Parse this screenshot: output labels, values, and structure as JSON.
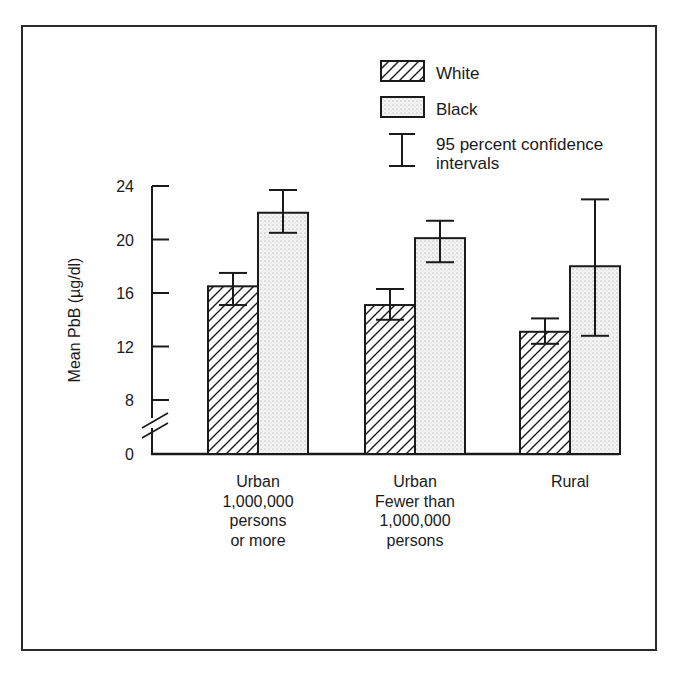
{
  "chart_data": {
    "type": "bar",
    "title": "",
    "xlabel": "",
    "ylabel": "Mean PbB (µg/dl)",
    "ylim": [
      0,
      24
    ],
    "yticks": [
      0,
      8,
      12,
      16,
      20,
      24
    ],
    "axis_break": "between 0 and 8",
    "grid": false,
    "legend_position": "top-right",
    "categories": [
      [
        "Urban",
        "1,000,000",
        "persons",
        "or more"
      ],
      [
        "Urban",
        "Fewer than",
        "1,000,000",
        "persons"
      ],
      [
        "Rural"
      ]
    ],
    "category_labels": [
      "Urban 1,000,000 persons or more",
      "Urban Fewer than 1,000,000 persons",
      "Rural"
    ],
    "series": [
      {
        "name": "White",
        "pattern": "diagonal-hatch",
        "values": [
          16.5,
          15.1,
          13.1
        ],
        "ci_low": [
          15.1,
          14.0,
          12.2
        ],
        "ci_high": [
          17.5,
          16.3,
          14.1
        ]
      },
      {
        "name": "Black",
        "pattern": "stipple",
        "values": [
          22.0,
          20.1,
          18.0
        ],
        "ci_low": [
          20.5,
          18.3,
          12.8
        ],
        "ci_high": [
          23.7,
          21.4,
          23.0
        ]
      }
    ],
    "legend": [
      {
        "label": "White",
        "symbol": "hatched-box"
      },
      {
        "label": "Black",
        "symbol": "dotted-box"
      },
      {
        "label_lines": [
          "95 percent confidence",
          "intervals"
        ],
        "symbol": "error-bar"
      }
    ]
  }
}
